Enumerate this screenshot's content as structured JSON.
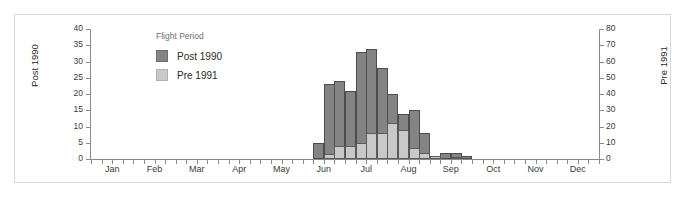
{
  "chart_data": {
    "type": "bar",
    "title": "",
    "subtitle": "",
    "legend_title": "Flight Period",
    "legend_position": "inside-top-left",
    "grid": false,
    "xlabel": "",
    "x_tick_labels": [
      "Jan",
      "Feb",
      "Mar",
      "Apr",
      "May",
      "Jun",
      "Jul",
      "Aug",
      "Sep",
      "Oct",
      "Nov",
      "Dec"
    ],
    "left_axis": {
      "label": "Post 1990",
      "ylim": [
        0,
        40
      ],
      "ticks": [
        0,
        5,
        10,
        15,
        20,
        25,
        30,
        35,
        40
      ]
    },
    "right_axis": {
      "label": "Pre 1991",
      "ylim": [
        0,
        80
      ],
      "ticks": [
        0,
        10,
        20,
        30,
        40,
        50,
        60,
        70,
        80
      ]
    },
    "series": [
      {
        "name": "Post 1990",
        "axis": "left",
        "color": "#848484",
        "values": [
          0,
          0,
          0,
          0,
          0,
          0,
          0,
          0,
          0,
          0,
          0,
          0,
          0,
          0,
          0,
          0,
          0,
          0,
          0,
          0,
          0,
          5,
          23,
          24,
          21,
          33,
          34,
          28,
          20,
          14,
          15,
          8,
          0,
          2,
          2,
          1,
          0,
          0,
          0,
          0,
          0,
          0,
          0,
          0,
          0,
          0,
          0,
          0
        ]
      },
      {
        "name": "Pre 1991",
        "axis": "right",
        "color": "#c9c9c9",
        "values": [
          0,
          0,
          0,
          0,
          0,
          0,
          0,
          0,
          0,
          0,
          0,
          0,
          0,
          0,
          0,
          0,
          0,
          0,
          0,
          0,
          0,
          0,
          3,
          8,
          8,
          10,
          16,
          16,
          22,
          18,
          7,
          4,
          2,
          0,
          1,
          0,
          0,
          0,
          0,
          0,
          0,
          0,
          0,
          0,
          0,
          0,
          0,
          0
        ]
      }
    ],
    "x_index_count": 48
  }
}
